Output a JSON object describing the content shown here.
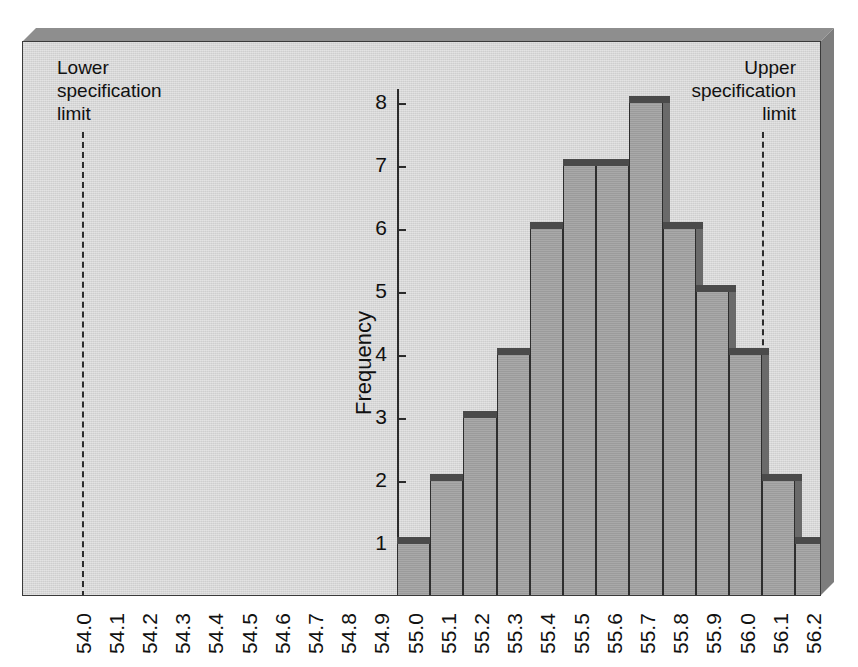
{
  "chart_data": {
    "type": "bar",
    "title": "",
    "subtitle": "",
    "xlabel": "",
    "ylabel": "Frequency",
    "categories": [
      "54.0",
      "54.1",
      "54.2",
      "54.3",
      "54.4",
      "54.5",
      "54.6",
      "54.7",
      "54.8",
      "54.9",
      "55.0",
      "55.1",
      "55.2",
      "55.3",
      "55.4",
      "55.5",
      "55.6",
      "55.7",
      "55.8",
      "55.9",
      "56.0",
      "56.1",
      "56.2"
    ],
    "values": [
      0,
      0,
      0,
      0,
      0,
      0,
      0,
      0,
      0,
      0,
      1,
      2,
      3,
      4,
      6,
      7,
      7,
      8,
      6,
      5,
      4,
      2,
      1
    ],
    "ylim": [
      0,
      8
    ],
    "ytick_labels": [
      "1",
      "2",
      "3",
      "4",
      "5",
      "6",
      "7",
      "8"
    ],
    "ytick_values": [
      1,
      2,
      3,
      4,
      5,
      6,
      7,
      8
    ],
    "grid": false,
    "legend": "none",
    "annotations": [
      {
        "name": "lower-specification-limit",
        "label": "Lower\nspecification\nlimit",
        "x_value": "54.0",
        "line_style": "dashed"
      },
      {
        "name": "upper-specification-limit",
        "label": "Upper\nspecification\nlimit",
        "x_value": "56.05",
        "line_style": "dashed"
      }
    ],
    "colors": {
      "panel_background": "#d7d7d7",
      "bar_face": "#9b9b9b",
      "bar_top": "#4a4a4a",
      "bar_side": "#6a6a6a",
      "axis": "#2b2b2b",
      "frame_top_bevel": "#8e8e8e",
      "frame_right_bevel": "#7d7d7d",
      "text": "#111111"
    }
  }
}
